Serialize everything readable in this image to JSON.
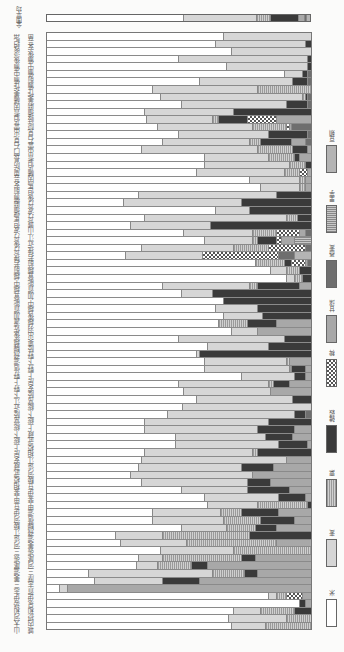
{
  "chart_data": {
    "type": "bar",
    "orientation": "horizontal-stacked-100pct",
    "title": "",
    "xlabel": "",
    "ylabel": "",
    "xlim": [
      0,
      100
    ],
    "legend_position": "right",
    "series_names": [
      "米",
      "麦",
      "粟",
      "雑穀",
      "稗",
      "甘藷",
      "蕎麦",
      "里芋",
      "豆類"
    ],
    "series_keys": [
      "rice",
      "wheat",
      "millet",
      "grain",
      "hie",
      "sweetpotato",
      "buckwheat",
      "taro",
      "beans"
    ],
    "average": {
      "label": "全国平均",
      "values": [
        52,
        28,
        5,
        11,
        0,
        2,
        1,
        0,
        1
      ]
    },
    "rows": [
      [
        67,
        33,
        0,
        0,
        0,
        0,
        0,
        0,
        0
      ],
      [
        64,
        34,
        0,
        2,
        0,
        0,
        0,
        0,
        0
      ],
      [
        70,
        30,
        0,
        0,
        0,
        0,
        0,
        0,
        0
      ],
      [
        50,
        49,
        0,
        1,
        0,
        0,
        0,
        0,
        0
      ],
      [
        68,
        31,
        0,
        1,
        0,
        0,
        0,
        0,
        0
      ],
      [
        90,
        7,
        0,
        2,
        0,
        0,
        1,
        0,
        0
      ],
      [
        58,
        35,
        0,
        6,
        0,
        0,
        1,
        0,
        0
      ],
      [
        40,
        40,
        20,
        0,
        0,
        0,
        0,
        0,
        0
      ],
      [
        43,
        54,
        1,
        1,
        0,
        0,
        1,
        0,
        0
      ],
      [
        51,
        40,
        0,
        8,
        0,
        0,
        1,
        0,
        0
      ],
      [
        37,
        34,
        0,
        29,
        0,
        0,
        0,
        0,
        0
      ],
      [
        38,
        25,
        2,
        11,
        11,
        13,
        0,
        0,
        0
      ],
      [
        42,
        36,
        13,
        0,
        1,
        1,
        7,
        0,
        0
      ],
      [
        50,
        34,
        0,
        15,
        0,
        0,
        1,
        0,
        0
      ],
      [
        44,
        33,
        4,
        12,
        0,
        5,
        2,
        0,
        0
      ],
      [
        36,
        44,
        13,
        6,
        0,
        1,
        0,
        0,
        0
      ],
      [
        60,
        24,
        10,
        2,
        0,
        4,
        0,
        0,
        0
      ],
      [
        60,
        32,
        6,
        2,
        0,
        0,
        0,
        0,
        0
      ],
      [
        57,
        33,
        6,
        0,
        3,
        1,
        0,
        0,
        0
      ],
      [
        77,
        19,
        2,
        0,
        0,
        2,
        0,
        0,
        0
      ],
      [
        81,
        15,
        2,
        0,
        0,
        2,
        0,
        0,
        0
      ],
      [
        35,
        52,
        0,
        13,
        0,
        0,
        0,
        0,
        0
      ],
      [
        29,
        45,
        0,
        26,
        0,
        0,
        0,
        0,
        0
      ],
      [
        64,
        13,
        0,
        23,
        0,
        0,
        0,
        0,
        0
      ],
      [
        37,
        54,
        4,
        5,
        0,
        0,
        0,
        0,
        0
      ],
      [
        32,
        30,
        0,
        38,
        0,
        0,
        0,
        0,
        0
      ],
      [
        52,
        26,
        9,
        0,
        9,
        2,
        2,
        0,
        0
      ],
      [
        60,
        18,
        2,
        7,
        2,
        5,
        0,
        6,
        0
      ],
      [
        36,
        35,
        13,
        0,
        14,
        0,
        2,
        0,
        0
      ],
      [
        30,
        29,
        0,
        0,
        29,
        0,
        6,
        0,
        6
      ],
      [
        79,
        0,
        11,
        3,
        5,
        1,
        1,
        0,
        0
      ],
      [
        85,
        6,
        5,
        4,
        0,
        0,
        0,
        0,
        0
      ],
      [
        91,
        3,
        3,
        3,
        0,
        0,
        0,
        0,
        0
      ],
      [
        44,
        33,
        3,
        16,
        0,
        4,
        0,
        0,
        0
      ],
      [
        51,
        12,
        0,
        37,
        0,
        0,
        0,
        0,
        0
      ],
      [
        67,
        0,
        0,
        33,
        0,
        0,
        0,
        0,
        0
      ],
      [
        64,
        16,
        0,
        20,
        0,
        0,
        0,
        0,
        0
      ],
      [
        67,
        15,
        0,
        18,
        0,
        0,
        0,
        0,
        0
      ],
      [
        65,
        0,
        11,
        11,
        0,
        13,
        0,
        0,
        0
      ],
      [
        70,
        10,
        0,
        0,
        0,
        20,
        0,
        0,
        0
      ],
      [
        50,
        40,
        0,
        10,
        0,
        0,
        0,
        0,
        0
      ],
      [
        61,
        23,
        0,
        16,
        0,
        0,
        0,
        0,
        0
      ],
      [
        57,
        1,
        0,
        42,
        0,
        0,
        0,
        0,
        0
      ],
      [
        60,
        31,
        1,
        0,
        0,
        8,
        0,
        0,
        0
      ],
      [
        60,
        32,
        1,
        5,
        0,
        2,
        0,
        0,
        0
      ],
      [
        74,
        20,
        0,
        4,
        0,
        2,
        0,
        0,
        0
      ],
      [
        50,
        34,
        2,
        6,
        0,
        8,
        0,
        0,
        0
      ],
      [
        52,
        33,
        0,
        0,
        0,
        15,
        0,
        0,
        0
      ],
      [
        57,
        36,
        0,
        7,
        0,
        0,
        0,
        0,
        0
      ],
      [
        52,
        49,
        0,
        0,
        0,
        0,
        0,
        0,
        0
      ],
      [
        46,
        48,
        0,
        4,
        0,
        0,
        2,
        0,
        0
      ],
      [
        37,
        47,
        0,
        16,
        0,
        0,
        0,
        0,
        0
      ],
      [
        37,
        43,
        0,
        14,
        0,
        6,
        0,
        0,
        0
      ],
      [
        49,
        34,
        0,
        10,
        0,
        7,
        0,
        0,
        0
      ],
      [
        49,
        39,
        0,
        11,
        0,
        1,
        0,
        0,
        0
      ],
      [
        37,
        41,
        2,
        20,
        0,
        0,
        0,
        0,
        0
      ],
      [
        36,
        55,
        0,
        0,
        0,
        9,
        0,
        0,
        0
      ],
      [
        35,
        39,
        0,
        12,
        0,
        14,
        0,
        0,
        0
      ],
      [
        32,
        46,
        0,
        0,
        0,
        22,
        0,
        0,
        0
      ],
      [
        36,
        40,
        0,
        9,
        0,
        15,
        0,
        0,
        0
      ],
      [
        51,
        25,
        0,
        16,
        0,
        8,
        0,
        0,
        0
      ],
      [
        60,
        28,
        0,
        10,
        0,
        2,
        0,
        0,
        0
      ],
      [
        61,
        19,
        19,
        1,
        0,
        0,
        0,
        0,
        0
      ],
      [
        40,
        26,
        8,
        14,
        0,
        12,
        0,
        0,
        0
      ],
      [
        40,
        27,
        14,
        13,
        0,
        6,
        0,
        0,
        0
      ],
      [
        51,
        17,
        11,
        8,
        0,
        13,
        0,
        0,
        0
      ],
      [
        26,
        18,
        33,
        23,
        0,
        0,
        0,
        0,
        0
      ],
      [
        28,
        25,
        34,
        0,
        0,
        13,
        0,
        0,
        0
      ],
      [
        43,
        28,
        29,
        0,
        0,
        0,
        0,
        0,
        0
      ],
      [
        35,
        9,
        30,
        5,
        0,
        21,
        0,
        0,
        0
      ],
      [
        34,
        8,
        13,
        6,
        0,
        39,
        0,
        0,
        0
      ],
      [
        16,
        47,
        12,
        5,
        0,
        20,
        0,
        0,
        0
      ],
      [
        18,
        26,
        0,
        14,
        0,
        42,
        0,
        0,
        0
      ],
      [
        5,
        3,
        0,
        0,
        0,
        92,
        0,
        0,
        0
      ],
      [
        84,
        3,
        4,
        0,
        6,
        3,
        0,
        0,
        0
      ],
      [
        96,
        0,
        0,
        2,
        0,
        2,
        0,
        0,
        0
      ],
      [
        71,
        10,
        13,
        6,
        0,
        0,
        0,
        0,
        0
      ],
      [
        69,
        22,
        9,
        0,
        0,
        0,
        0,
        0,
        0
      ],
      [
        70,
        13,
        17,
        0,
        0,
        0,
        0,
        0,
        0
      ]
    ]
  },
  "average_label": "全国平均",
  "labels_col1": "山大河和勢伊志三美濃尾張三河遠江駿河伊豆甲斐相模武蔵安房上総下総常陸近江下野上野信濃飛騨越後佐渡加賀能登越中越前若狭丹後丹波但馬播磨備前安芸周防長門石見出雲伯耆因幡美作備中備後淡路紀伊阿波讃岐伊予土佐筑前筑後豊前肥前肥後大隅薩摩壱岐対馬日向豊後石見",
  "labels_col2": "城内摂和泉伊賀志摩三河尾張美濃飛騨信濃甲斐伊豆駿河遠江相模武蔵上総下総常陸安房上野下野陸奥出羽越後越中加賀能登越前若狭近江山城丹波丹後但馬因幡伯耆出雲石見隠岐播磨美作備前備中備後安芸周防長門紀伊淡路阿波讃岐伊予土佐筑前筑後豊前豊後肥前肥後日向大隅薩摩",
  "legend": [
    {
      "key": "rice",
      "label": "米"
    },
    {
      "key": "wheat",
      "label": "麦"
    },
    {
      "key": "millet",
      "label": "粟"
    },
    {
      "key": "grain",
      "label": "雑穀"
    },
    {
      "key": "hie",
      "label": "稗"
    },
    {
      "key": "sweetpotato",
      "label": "甘藷"
    },
    {
      "key": "buckwheat",
      "label": "蕎麦"
    },
    {
      "key": "taro",
      "label": "里芋"
    },
    {
      "key": "beans",
      "label": "豆類"
    }
  ]
}
